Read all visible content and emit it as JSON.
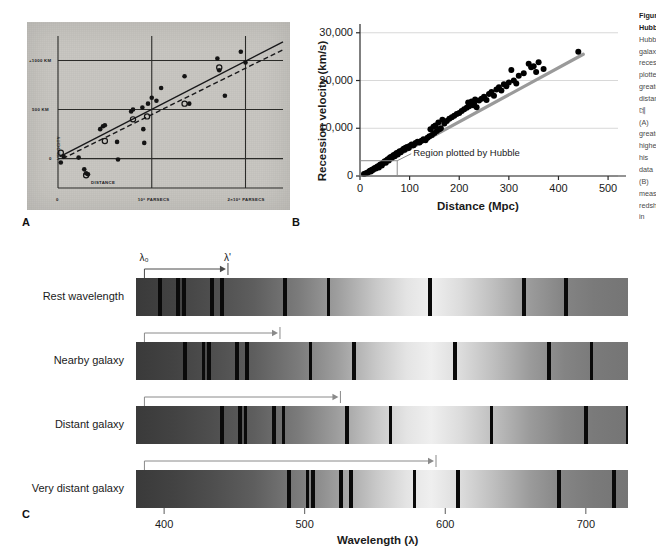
{
  "figure": {
    "panel_letters": [
      {
        "label": "A",
        "x": 22,
        "y": 218
      },
      {
        "label": "B",
        "x": 292,
        "y": 218
      },
      {
        "label": "C",
        "x": 22,
        "y": 512
      }
    ]
  },
  "panel_a": {
    "name": "Hubble's original 1929 velocity-distance diagram",
    "style": "grey halftone photographic plate reproduction",
    "axis": {
      "ylabel": "VELOCITY",
      "xlabel": "DISTANCE",
      "yticks": [
        "+1000 KM",
        "500 KM",
        "0"
      ],
      "xticks": [
        "0",
        "10⁶ PARSECS",
        "2×10⁶ PARSECS"
      ]
    },
    "series_note": "filled circles and open circles with solid and dashed regression lines"
  },
  "panel_b": {
    "axis": {
      "ylabel": "Recession velocity (km/s)",
      "xlabel": "Distance (Mpc)",
      "yticks": [
        "0",
        "10,000",
        "20,000",
        "30,000"
      ],
      "xticks": [
        "0",
        "100",
        "200",
        "300",
        "400",
        "500"
      ]
    },
    "annotation": "Region plotted by Hubble",
    "inset_box": {
      "x_from": 0,
      "x_to": 75,
      "y_from": 0,
      "y_to": 3000
    },
    "fit_color": "#9a9a9a",
    "point_color": "#111111"
  },
  "panel_c": {
    "rows": [
      {
        "label": "Rest wavelength"
      },
      {
        "label": "Nearby galaxy"
      },
      {
        "label": "Distant galaxy"
      },
      {
        "label": "Very distant galaxy"
      }
    ],
    "lambda_rest": "λ₀",
    "lambda_shift": "λ'",
    "axis": {
      "xlabel": "Wavelength (λ)",
      "xticks": [
        "400",
        "500",
        "600",
        "700"
      ]
    }
  },
  "chart_data": [
    {
      "type": "scatter",
      "id": "panel_a",
      "title": "",
      "xlabel": "DISTANCE",
      "ylabel": "VELOCITY",
      "xlim": [
        0,
        2.4
      ],
      "ylim": [
        -300,
        1250
      ],
      "xtick_values": [
        0,
        1,
        2
      ],
      "xtick_labels": [
        "0",
        "10⁶ PARSECS",
        "2×10⁶ PARSECS"
      ],
      "ytick_values": [
        0,
        500,
        1000
      ],
      "ytick_labels": [
        "0",
        "500 KM",
        "+1000 KM"
      ],
      "grid": true,
      "series": [
        {
          "name": "individual nebulae (filled circles)",
          "marker": "filled-circle",
          "x": [
            0.03,
            0.06,
            0.22,
            0.28,
            0.3,
            0.32,
            0.45,
            0.48,
            0.5,
            0.63,
            0.64,
            0.78,
            0.8,
            0.9,
            0.91,
            0.92,
            0.96,
            1.0,
            1.05,
            1.1,
            1.35,
            1.4,
            1.7,
            1.72,
            1.78,
            1.95,
            2.0
          ],
          "y": [
            -40,
            20,
            10,
            -110,
            -150,
            -160,
            300,
            330,
            340,
            170,
            -10,
            480,
            500,
            520,
            300,
            160,
            560,
            620,
            590,
            720,
            840,
            560,
            1020,
            900,
            640,
            1090,
            980
          ]
        },
        {
          "name": "group means (open circles)",
          "marker": "open-circle",
          "x": [
            0.03,
            0.3,
            0.5,
            0.8,
            0.95,
            1.35,
            1.72
          ],
          "y": [
            60,
            -170,
            180,
            400,
            430,
            560,
            930
          ]
        }
      ],
      "fits": [
        {
          "name": "solid line",
          "style": "solid",
          "x": [
            0.02,
            2.4
          ],
          "y": [
            20,
            1190
          ]
        },
        {
          "name": "dashed line",
          "style": "dashed",
          "x": [
            0.05,
            2.4
          ],
          "y": [
            0,
            1110
          ]
        }
      ]
    },
    {
      "type": "scatter",
      "id": "panel_b",
      "title": "",
      "xlabel": "Distance (Mpc)",
      "ylabel": "Recession velocity (km/s)",
      "xlim": [
        0,
        520
      ],
      "ylim": [
        0,
        31000
      ],
      "xtick_values": [
        0,
        100,
        200,
        300,
        400,
        500
      ],
      "xtick_labels": [
        "0",
        "100",
        "200",
        "300",
        "400",
        "500"
      ],
      "ytick_values": [
        0,
        10000,
        20000,
        30000
      ],
      "ytick_labels": [
        "0",
        "10,000",
        "20,000",
        "30,000"
      ],
      "grid": "horizontal",
      "legend": null,
      "annotations": [
        {
          "text": "Region plotted by Hubble",
          "x": 95,
          "y": 3200,
          "box": {
            "x0": 0,
            "x1": 75,
            "y0": 0,
            "y1": 3200
          }
        }
      ],
      "fit_line": {
        "name": "Hubble law best fit",
        "x": [
          5,
          450
        ],
        "y": [
          300,
          25500
        ],
        "slope_km_s_per_Mpc": 56,
        "color": "#9a9a9a"
      },
      "points": [
        [
          8,
          400
        ],
        [
          12,
          550
        ],
        [
          15,
          700
        ],
        [
          18,
          900
        ],
        [
          20,
          1100
        ],
        [
          22,
          950
        ],
        [
          24,
          1300
        ],
        [
          26,
          1250
        ],
        [
          28,
          1500
        ],
        [
          30,
          1700
        ],
        [
          32,
          1550
        ],
        [
          34,
          1900
        ],
        [
          36,
          2050
        ],
        [
          38,
          1800
        ],
        [
          40,
          2300
        ],
        [
          42,
          2450
        ],
        [
          44,
          2200
        ],
        [
          46,
          2600
        ],
        [
          48,
          2900
        ],
        [
          50,
          3100
        ],
        [
          52,
          2800
        ],
        [
          54,
          3300
        ],
        [
          56,
          3500
        ],
        [
          58,
          3250
        ],
        [
          60,
          3800
        ],
        [
          62,
          4000
        ],
        [
          64,
          3700
        ],
        [
          66,
          4200
        ],
        [
          68,
          4400
        ],
        [
          70,
          4150
        ],
        [
          72,
          4600
        ],
        [
          74,
          4800
        ],
        [
          76,
          4500
        ],
        [
          78,
          5000
        ],
        [
          80,
          5200
        ],
        [
          82,
          4950
        ],
        [
          85,
          5400
        ],
        [
          88,
          5700
        ],
        [
          90,
          5500
        ],
        [
          92,
          5900
        ],
        [
          95,
          6100
        ],
        [
          98,
          5850
        ],
        [
          100,
          6300
        ],
        [
          104,
          6600
        ],
        [
          108,
          6450
        ],
        [
          112,
          6900
        ],
        [
          116,
          7200
        ],
        [
          120,
          7000
        ],
        [
          124,
          7400
        ],
        [
          128,
          7700
        ],
        [
          132,
          7500
        ],
        [
          136,
          8000
        ],
        [
          140,
          8300
        ],
        [
          142,
          9800
        ],
        [
          145,
          8600
        ],
        [
          148,
          10300
        ],
        [
          150,
          9000
        ],
        [
          152,
          10600
        ],
        [
          155,
          9400
        ],
        [
          158,
          11200
        ],
        [
          160,
          9800
        ],
        [
          163,
          10000
        ],
        [
          166,
          11800
        ],
        [
          170,
          11000
        ],
        [
          175,
          11500
        ],
        [
          180,
          12000
        ],
        [
          185,
          12300
        ],
        [
          190,
          12600
        ],
        [
          195,
          13000
        ],
        [
          200,
          13200
        ],
        [
          205,
          13600
        ],
        [
          210,
          14000
        ],
        [
          215,
          14300
        ],
        [
          218,
          15400
        ],
        [
          220,
          14600
        ],
        [
          222,
          15000
        ],
        [
          225,
          15600
        ],
        [
          228,
          14800
        ],
        [
          230,
          15200
        ],
        [
          232,
          16000
        ],
        [
          235,
          14400
        ],
        [
          240,
          15800
        ],
        [
          245,
          16200
        ],
        [
          250,
          16600
        ],
        [
          255,
          15900
        ],
        [
          260,
          17200
        ],
        [
          265,
          17600
        ],
        [
          270,
          16800
        ],
        [
          275,
          18100
        ],
        [
          280,
          18600
        ],
        [
          285,
          17900
        ],
        [
          290,
          19200
        ],
        [
          295,
          18800
        ],
        [
          300,
          19600
        ],
        [
          305,
          22200
        ],
        [
          310,
          20000
        ],
        [
          315,
          19400
        ],
        [
          320,
          21000
        ],
        [
          330,
          21500
        ],
        [
          340,
          23500
        ],
        [
          345,
          22800
        ],
        [
          350,
          23000
        ],
        [
          355,
          21800
        ],
        [
          360,
          23800
        ],
        [
          370,
          22400
        ],
        [
          440,
          26000
        ]
      ]
    },
    {
      "type": "spectra",
      "id": "panel_c",
      "xlabel": "Wavelength (λ)",
      "xlim": [
        380,
        730
      ],
      "xtick_values": [
        400,
        500,
        600,
        700
      ],
      "xtick_labels": [
        "400",
        "500",
        "600",
        "700"
      ],
      "rows": [
        {
          "label": "Rest wavelength",
          "shift_nm": 0,
          "lines_nm": [
            397,
            410,
            414,
            434,
            441,
            486,
            517,
            589,
            656,
            686
          ],
          "arrow_from_nm": 386,
          "arrow_to_nm": 444
        },
        {
          "label": "Nearby galaxy",
          "shift_nm": 18,
          "lines_nm": [
            415,
            428,
            432,
            452,
            459,
            504,
            535,
            607,
            674,
            704
          ],
          "arrow_from_nm": 386,
          "arrow_to_nm": 481
        },
        {
          "label": "Distant galaxy",
          "shift_nm": 44,
          "lines_nm": [
            441,
            454,
            458,
            478,
            485,
            530,
            561,
            633,
            700,
            730
          ],
          "arrow_from_nm": 386,
          "arrow_to_nm": 524
        },
        {
          "label": "Very distant galaxy",
          "shift_nm": 92,
          "lines_nm": [
            489,
            502,
            506,
            526,
            533,
            578,
            609,
            681,
            720
          ],
          "arrow_from_nm": 386,
          "arrow_to_nm": 592
        }
      ]
    }
  ],
  "caption": {
    "lines": [
      {
        "text": "Figure",
        "bold": true
      },
      {
        "text": "Hubble",
        "bold": true
      },
      {
        "text": "Hubble",
        "bold": false
      },
      {
        "text": "galaxies",
        "bold": false
      },
      {
        "text": "recession",
        "bold": false
      },
      {
        "text": "plotted",
        "bold": false
      },
      {
        "text": "greater",
        "bold": false
      },
      {
        "text": "distances",
        "bold": false
      },
      {
        "text": "데",
        "bold": false
      },
      {
        "text": "(A)",
        "bold": false
      },
      {
        "text": "greater",
        "bold": false
      },
      {
        "text": "higher",
        "bold": false
      },
      {
        "text": "his",
        "bold": false
      },
      {
        "text": "data",
        "bold": false
      },
      {
        "text": "(B)",
        "bold": false
      },
      {
        "text": "measured",
        "bold": false
      },
      {
        "text": "redshift",
        "bold": false
      },
      {
        "text": "in",
        "bold": false
      },
      {
        "text": "from",
        "bold": false
      },
      {
        "text": "longer",
        "bold": false
      },
      {
        "text": "wavelengths",
        "bold": false
      },
      {
        "text": "galaxy",
        "bold": false
      },
      {
        "text": "the",
        "bold": false
      }
    ]
  }
}
